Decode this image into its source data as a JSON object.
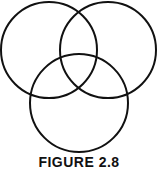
{
  "diagram": {
    "type": "venn",
    "stroke_color": "#111111",
    "background": "#ffffff",
    "circles": [
      {
        "name": "top-left",
        "cx": 49,
        "cy": 50,
        "r": 48
      },
      {
        "name": "top-right",
        "cx": 108,
        "cy": 50,
        "r": 48
      },
      {
        "name": "bottom",
        "cx": 79,
        "cy": 103,
        "r": 49
      }
    ],
    "caption": "FIGURE 2.8"
  }
}
